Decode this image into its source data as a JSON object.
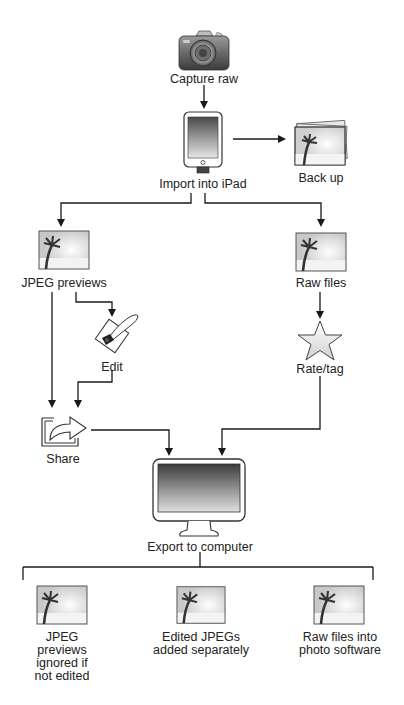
{
  "diagram": {
    "nodes": {
      "capture": {
        "label": "Capture raw",
        "icon": "camera-icon"
      },
      "import": {
        "label": "Import into iPad",
        "icon": "ipad-icon"
      },
      "backup": {
        "label": "Back up",
        "icon": "photo-stack-icon"
      },
      "jpeg_previews": {
        "label": "JPEG previews",
        "icon": "photo-icon"
      },
      "raw_files": {
        "label": "Raw files",
        "icon": "photo-icon"
      },
      "edit": {
        "label": "Edit",
        "icon": "edit-quill-icon"
      },
      "rate_tag": {
        "label": "Rate/tag",
        "icon": "star-icon"
      },
      "share": {
        "label": "Share",
        "icon": "share-arrow-icon"
      },
      "export": {
        "label": "Export to computer",
        "icon": "monitor-icon"
      },
      "out_jpeg_ignored": {
        "label_lines": [
          "JPEG",
          "previews",
          "ignored if",
          "not edited"
        ],
        "icon": "photo-icon"
      },
      "out_edited_jpegs": {
        "label_lines": [
          "Edited JPEGs",
          "added separately"
        ],
        "icon": "photo-icon"
      },
      "out_raw_software": {
        "label_lines": [
          "Raw files into",
          "photo software"
        ],
        "icon": "photo-icon"
      }
    },
    "edges": [
      {
        "from": "Capture raw",
        "to": "Import into iPad"
      },
      {
        "from": "Import into iPad",
        "to": "Back up"
      },
      {
        "from": "Import into iPad",
        "to": "JPEG previews"
      },
      {
        "from": "Import into iPad",
        "to": "Raw files"
      },
      {
        "from": "JPEG previews",
        "to": "Edit"
      },
      {
        "from": "JPEG previews",
        "to": "Share"
      },
      {
        "from": "Edit",
        "to": "Share"
      },
      {
        "from": "Raw files",
        "to": "Rate/tag"
      },
      {
        "from": "Share",
        "to": "Export to computer"
      },
      {
        "from": "Rate/tag",
        "to": "Export to computer"
      },
      {
        "from": "Export to computer",
        "to": "JPEG previews ignored if not edited"
      },
      {
        "from": "Export to computer",
        "to": "Edited JPEGs added separately"
      },
      {
        "from": "Export to computer",
        "to": "Raw files into photo software"
      }
    ],
    "colors": {
      "line": "#1a1a1a",
      "text": "#222222",
      "icon_stroke": "#444444"
    }
  }
}
